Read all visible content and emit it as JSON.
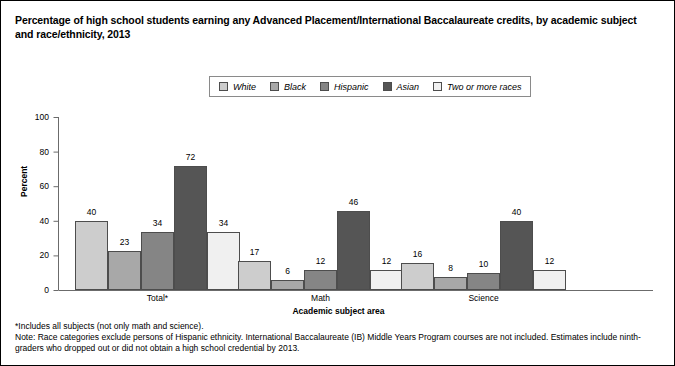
{
  "figure": {
    "title": "Percentage of high school students earning any Advanced Placement/International Baccalaureate credits, by academic subject and race/ethnicity, 2013",
    "border_color": "#000000"
  },
  "notes": {
    "asterisk": "*Includes all subjects (not only math and science).",
    "note": "Note: Race categories exclude persons of Hispanic ethnicity. International Baccalaureate (IB) Middle Years Program courses are not included. Estimates include ninth-graders who dropped out or did not obtain a high school credential by 2013."
  },
  "chart_data": {
    "type": "bar",
    "title": "Percentage of high school students earning any Advanced Placement/International Baccalaureate credits, by academic subject and race/ethnicity, 2013",
    "xlabel": "Academic subject area",
    "ylabel": "Percent",
    "ylim": [
      0,
      100
    ],
    "yticks": [
      0,
      20,
      40,
      60,
      80,
      100
    ],
    "grid": false,
    "legend_position": "top-center",
    "categories": [
      "Total*",
      "Math",
      "Science"
    ],
    "series": [
      {
        "name": "White",
        "color": "#cdcdcd",
        "values": [
          40,
          17,
          16
        ]
      },
      {
        "name": "Black",
        "color": "#a8a8a8",
        "values": [
          23,
          6,
          8
        ]
      },
      {
        "name": "Hispanic",
        "color": "#858585",
        "values": [
          34,
          12,
          10
        ]
      },
      {
        "name": "Asian",
        "color": "#555555",
        "values": [
          72,
          46,
          40
        ]
      },
      {
        "name": "Two or more races",
        "color": "#f0f0f0",
        "values": [
          34,
          12,
          12
        ]
      }
    ]
  }
}
